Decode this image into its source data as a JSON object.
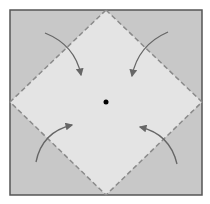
{
  "diagram": {
    "type": "origami-fold-step",
    "colors": {
      "paper_outer": "#c8c8c8",
      "paper_inner": "#e4e4e4",
      "border": "#555555",
      "fold_line": "#8a8a8a",
      "arrow": "#666666",
      "center_dot": "#000000"
    },
    "square": {
      "x": 10,
      "y": 10,
      "w": 192,
      "h": 185
    },
    "center": {
      "x": 106,
      "y": 102
    },
    "arrows": [
      {
        "name": "top-left",
        "from": [
          45,
          33
        ],
        "to": [
          81,
          75
        ]
      },
      {
        "name": "top-right",
        "from": [
          168,
          32
        ],
        "to": [
          132,
          76
        ]
      },
      {
        "name": "bottom-left",
        "from": [
          36,
          162
        ],
        "to": [
          72,
          125
        ]
      },
      {
        "name": "bottom-right",
        "from": [
          177,
          164
        ],
        "to": [
          140,
          127
        ]
      }
    ]
  }
}
